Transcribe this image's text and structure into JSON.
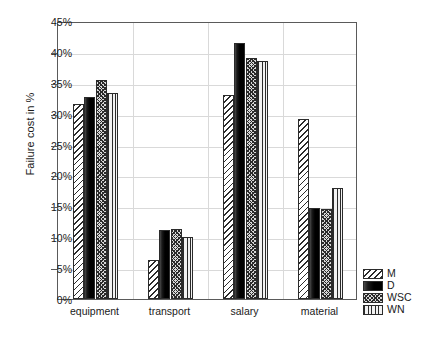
{
  "chart_data": {
    "type": "bar",
    "title": "",
    "xlabel": "",
    "ylabel": "Failure cost in %",
    "categories": [
      "equipment",
      "transport",
      "salary",
      "material"
    ],
    "series": [
      {
        "name": "M",
        "values": [
          31.6,
          6.3,
          33.0,
          29.2
        ],
        "pattern": "diagonal-hatch"
      },
      {
        "name": "D",
        "values": [
          32.7,
          11.1,
          41.5,
          14.7
        ],
        "pattern": "solid-black"
      },
      {
        "name": "WSC",
        "values": [
          35.4,
          11.3,
          39.0,
          14.5
        ],
        "pattern": "cross-hatch"
      },
      {
        "name": "WN",
        "values": [
          33.4,
          10.0,
          38.5,
          18.0
        ],
        "pattern": "vertical-lines"
      }
    ],
    "ylim": [
      0,
      45
    ],
    "ytick_step": 5,
    "ytick_labels": [
      "0%",
      "5%",
      "10%",
      "15%",
      "20%",
      "25%",
      "30%",
      "35%",
      "40%",
      "45%"
    ],
    "ytick_values": [
      0,
      5,
      10,
      15,
      20,
      25,
      30,
      35,
      40,
      45
    ],
    "grid": true,
    "legend_position": "bottom-right",
    "legend_entries": [
      "M",
      "D",
      "WSC",
      "WN"
    ],
    "axis_color": "#5a5a5a",
    "grid_color": "#d9d9d9",
    "bar_edge_color": "#2b2b2b",
    "text_color": "#1a1a1a",
    "background": "#ffffff"
  }
}
